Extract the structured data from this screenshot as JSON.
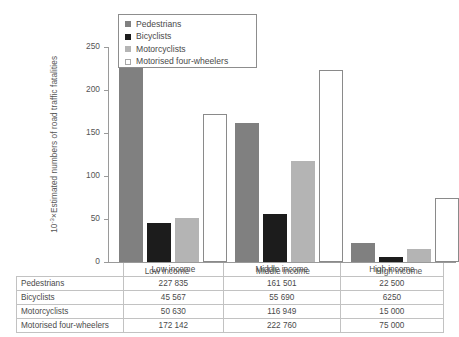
{
  "chart_data": {
    "type": "bar",
    "title": "",
    "xlabel": "",
    "ylabel": "10⁻³×Estimated numbers of road traffic fatalities",
    "ylabel_prefix": "10",
    "ylabel_exponent": "-3",
    "ylabel_rest": "×Estimated numbers of road traffic fatalities",
    "categories": [
      "Low income",
      "Middle income",
      "High income"
    ],
    "ylim": [
      0,
      250
    ],
    "yticks": [
      0,
      50,
      100,
      150,
      200,
      250
    ],
    "grid": false,
    "legend_position": "top-left-inside",
    "series": [
      {
        "name": "Pedestrians",
        "color": "#808080",
        "values": [
          227.835,
          161.501,
          22.5
        ],
        "labels": [
          "227 835",
          "161 501",
          "22 500"
        ]
      },
      {
        "name": "Bicyclists",
        "color": "#1c1c1c",
        "values": [
          45.567,
          55.69,
          6.25
        ],
        "labels": [
          "45 567",
          "55 690",
          "6250"
        ]
      },
      {
        "name": "Motorcyclists",
        "color": "#b4b4b4",
        "values": [
          50.63,
          116.949,
          15.0
        ],
        "labels": [
          "50 630",
          "116 949",
          "15 000"
        ]
      },
      {
        "name": "Motorised four-wheelers",
        "color": "#ffffff",
        "values": [
          172.142,
          222.76,
          75.0
        ],
        "labels": [
          "172 142",
          "222 760",
          "75 000"
        ]
      }
    ]
  },
  "legend": {
    "items": [
      {
        "label": "Pedestrians"
      },
      {
        "label": "Bicyclists"
      },
      {
        "label": "Motorcyclists"
      },
      {
        "label": "Motorised four-wheelers"
      }
    ]
  },
  "axis": {
    "y_tick_labels": [
      "250",
      "200",
      "150",
      "100",
      "50",
      "0"
    ],
    "x_tick_labels": [
      "Low income",
      "Middle income",
      "High income"
    ]
  },
  "table": {
    "corner": "",
    "columns": [
      "Low income",
      "Middle income",
      "High income"
    ],
    "rows": [
      {
        "label": "Pedestrians",
        "cells": [
          "227 835",
          "161 501",
          "22 500"
        ]
      },
      {
        "label": "Bicyclists",
        "cells": [
          "45 567",
          "55 690",
          "6250"
        ]
      },
      {
        "label": "Motorcyclists",
        "cells": [
          "50 630",
          "116 949",
          "15 000"
        ]
      },
      {
        "label": "Motorised four-wheelers",
        "cells": [
          "172 142",
          "222 760",
          "75 000"
        ]
      }
    ]
  }
}
